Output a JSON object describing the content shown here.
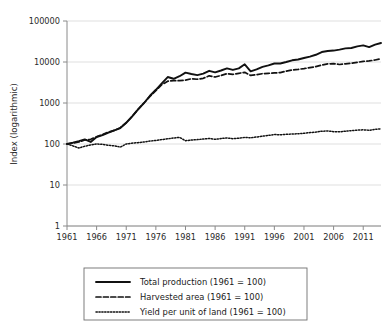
{
  "chart_data": {
    "type": "line",
    "title": "",
    "xlabel": "",
    "ylabel": "Index (logarithmic)",
    "yscale": "log",
    "ylim": [
      1,
      100000
    ],
    "xlim": [
      1961,
      2014
    ],
    "grid": true,
    "legend_position": "below",
    "ytick_labels": [
      "100000",
      "10000",
      "1000",
      "100",
      "10",
      "1"
    ],
    "ytick_values": [
      100000,
      10000,
      1000,
      100,
      10,
      1
    ],
    "xtick_labels": [
      "1961",
      "1966",
      "1971",
      "1976",
      "1981",
      "1986",
      "1991",
      "1996",
      "2001",
      "2006",
      "2011"
    ],
    "xtick_values": [
      1961,
      1966,
      1971,
      1976,
      1981,
      1986,
      1991,
      1996,
      2001,
      2006,
      2011
    ],
    "x": [
      1961,
      1962,
      1963,
      1964,
      1965,
      1966,
      1967,
      1968,
      1969,
      1970,
      1971,
      1972,
      1973,
      1974,
      1975,
      1976,
      1977,
      1978,
      1979,
      1980,
      1981,
      1982,
      1983,
      1984,
      1985,
      1986,
      1987,
      1988,
      1989,
      1990,
      1991,
      1992,
      1993,
      1994,
      1995,
      1996,
      1997,
      1998,
      1999,
      2000,
      2001,
      2002,
      2003,
      2004,
      2005,
      2006,
      2007,
      2008,
      2009,
      2010,
      2011,
      2012,
      2013,
      2014
    ],
    "series": [
      {
        "name": "Total production (1961 = 100)",
        "style": "solid",
        "color": "#111111",
        "values": [
          100,
          108,
          118,
          130,
          112,
          148,
          165,
          190,
          215,
          245,
          330,
          470,
          700,
          1000,
          1500,
          2100,
          3000,
          4300,
          3900,
          4500,
          5500,
          5100,
          4800,
          5200,
          6100,
          5600,
          6200,
          7000,
          6400,
          7000,
          8800,
          5900,
          6600,
          7600,
          8300,
          9200,
          9200,
          10000,
          11000,
          11500,
          12500,
          13500,
          15000,
          17500,
          18500,
          19000,
          20000,
          21500,
          22000,
          24000,
          25500,
          23000,
          26500,
          29000
        ]
      },
      {
        "name": "Harvested area (1961 = 100)",
        "style": "dashed",
        "color": "#111111",
        "values": [
          100,
          105,
          112,
          125,
          130,
          150,
          170,
          195,
          215,
          250,
          330,
          470,
          700,
          1000,
          1450,
          2000,
          2800,
          3400,
          3500,
          3500,
          3600,
          3900,
          3800,
          4000,
          4600,
          4300,
          4700,
          5200,
          5000,
          5300,
          5600,
          4700,
          4900,
          5200,
          5300,
          5400,
          5500,
          6000,
          6400,
          6600,
          6900,
          7300,
          7700,
          8400,
          9000,
          9100,
          8700,
          9000,
          9300,
          9800,
          10400,
          10600,
          11200,
          12000
        ]
      },
      {
        "name": "Yield per unit of land (1961 = 100)",
        "style": "dotted",
        "color": "#111111",
        "values": [
          100,
          90,
          80,
          88,
          95,
          100,
          98,
          93,
          90,
          84,
          100,
          105,
          108,
          112,
          118,
          122,
          128,
          134,
          140,
          145,
          120,
          125,
          128,
          132,
          136,
          130,
          136,
          140,
          135,
          138,
          145,
          142,
          148,
          155,
          162,
          170,
          168,
          172,
          175,
          178,
          182,
          190,
          195,
          205,
          208,
          200,
          198,
          205,
          212,
          218,
          222,
          216,
          228,
          235
        ]
      }
    ]
  },
  "legend": {
    "entries": [
      {
        "label": "Total production (1961 = 100)",
        "style": "solid"
      },
      {
        "label": "Harvested area (1961 = 100)",
        "style": "dashed"
      },
      {
        "label": "Yield per unit of land (1961 = 100)",
        "style": "dotted"
      }
    ]
  }
}
